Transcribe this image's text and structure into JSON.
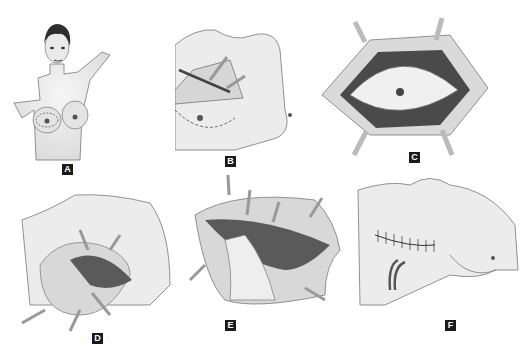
{
  "figure": {
    "panels": [
      {
        "label": "A",
        "description": "Frontal view of female patient with elliptical incision outline marked around right breast"
      },
      {
        "label": "B",
        "description": "Incision made; skin flap dissected with scalpel and retractors; dashed incision line"
      },
      {
        "label": "C",
        "description": "Elliptical skin island with nipple, flaps retracted by four retractors"
      },
      {
        "label": "D",
        "description": "Breast tissue being lifted off pectoral muscle with retractors"
      },
      {
        "label": "E",
        "description": "Hand retracting breast tissue exposing pectoralis muscle fibers; retractors around wound"
      },
      {
        "label": "F",
        "description": "Closed horizontal suture line with two surgical drains"
      }
    ]
  },
  "colors": {
    "background": "#ffffff",
    "skin": "#ececec",
    "outline": "#6a6a6a",
    "fat": "#d9d9d9",
    "muscle": "#5a5a5a",
    "badge": "#1a1a1a"
  }
}
